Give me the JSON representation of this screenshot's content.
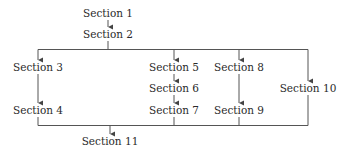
{
  "diagram": {
    "type": "flowchart",
    "colors": {
      "line": "#555555",
      "text": "#2a2a2a",
      "background": "#ffffff"
    },
    "nodes": [
      {
        "id": "s1",
        "label": "Section 1",
        "x": 108,
        "y": 13
      },
      {
        "id": "s2",
        "label": "Section 2",
        "x": 108,
        "y": 34
      },
      {
        "id": "s3",
        "label": "Section 3",
        "x": 38,
        "y": 67
      },
      {
        "id": "s4",
        "label": "Section 4",
        "x": 38,
        "y": 110
      },
      {
        "id": "s5",
        "label": "Section 5",
        "x": 174,
        "y": 67
      },
      {
        "id": "s6",
        "label": "Section 6",
        "x": 174,
        "y": 88
      },
      {
        "id": "s7",
        "label": "Section 7",
        "x": 174,
        "y": 110
      },
      {
        "id": "s8",
        "label": "Section 8",
        "x": 239,
        "y": 67
      },
      {
        "id": "s9",
        "label": "Section 9",
        "x": 239,
        "y": 110
      },
      {
        "id": "s10",
        "label": "Section 10",
        "x": 308,
        "y": 88
      },
      {
        "id": "s11",
        "label": "Section 11",
        "x": 110,
        "y": 141
      }
    ],
    "edges": [
      {
        "from": "Section 1",
        "to": "Section 2"
      },
      {
        "from": "Section 2",
        "to": "Section 3"
      },
      {
        "from": "Section 2",
        "to": "Section 5"
      },
      {
        "from": "Section 2",
        "to": "Section 8"
      },
      {
        "from": "Section 2",
        "to": "Section 10"
      },
      {
        "from": "Section 3",
        "to": "Section 4"
      },
      {
        "from": "Section 5",
        "to": "Section 6"
      },
      {
        "from": "Section 6",
        "to": "Section 7"
      },
      {
        "from": "Section 8",
        "to": "Section 9"
      },
      {
        "from": "Section 4",
        "to": "Section 11"
      },
      {
        "from": "Section 7",
        "to": "Section 11"
      },
      {
        "from": "Section 9",
        "to": "Section 11"
      },
      {
        "from": "Section 10",
        "to": "Section 11"
      }
    ]
  }
}
